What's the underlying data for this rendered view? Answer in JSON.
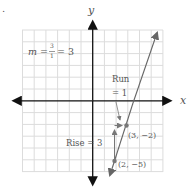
{
  "figure": {
    "bullet": ".",
    "axes": {
      "x_label": "x",
      "y_label": "y"
    },
    "slope_formula": {
      "m": "m",
      "equals": "=",
      "numerator": "3",
      "denominator": "1",
      "result": "= 3"
    },
    "run_label_line1": "Run",
    "run_label_line2": "= 1",
    "rise_label": "Rise = 3",
    "points": [
      {
        "label": "(3, −2)",
        "x": 3,
        "y": -2
      },
      {
        "label": "(2, −5)",
        "x": 2,
        "y": -5
      }
    ],
    "colors": {
      "grid": "#d8d8d8",
      "axis": "#111111",
      "line": "#666666",
      "point": "#777777",
      "text": "#555555"
    }
  }
}
